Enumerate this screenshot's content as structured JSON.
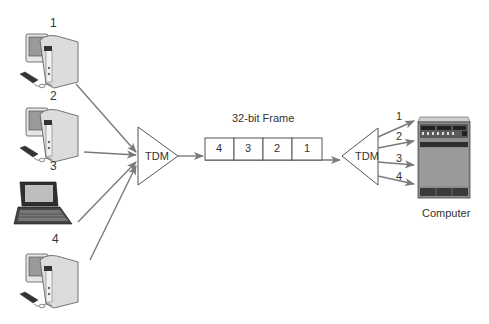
{
  "diagram": {
    "left_mux": {
      "label": "TDM"
    },
    "right_mux": {
      "label": "TDM"
    },
    "frame": {
      "label": "32-bit Frame",
      "slots": [
        "4",
        "3",
        "2",
        "1"
      ]
    },
    "sources": [
      {
        "id": "1",
        "type": "desktop-computer"
      },
      {
        "id": "2",
        "type": "desktop-computer"
      },
      {
        "id": "3",
        "type": "laptop-computer"
      },
      {
        "id": "4",
        "type": "desktop-computer"
      }
    ],
    "outputs": [
      "1",
      "2",
      "3",
      "4"
    ],
    "destination": {
      "label": "Computer",
      "type": "server"
    },
    "colors": {
      "arrow": "#7a7a7a",
      "line": "#555555",
      "device_body": "#d9d9d9",
      "device_dark": "#3a3a3a"
    }
  }
}
